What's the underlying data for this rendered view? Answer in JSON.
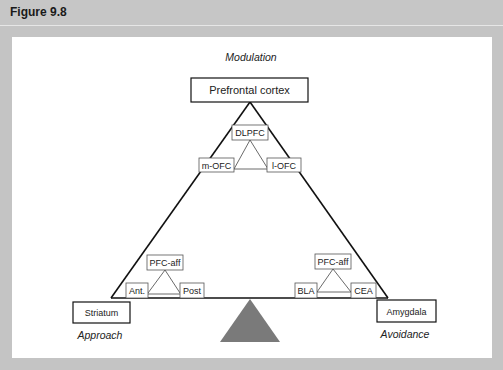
{
  "figure": {
    "title": "Figure 9.8"
  },
  "diagram": {
    "top_label": "Modulation",
    "apex_node": "Prefrontal cortex",
    "left_node": "Striatum",
    "right_node": "Amygdala",
    "left_caption": "Approach",
    "right_caption": "Avoidance",
    "top_subtriangle": {
      "top": "DLPFC",
      "left": "m-OFC",
      "right": "l-OFC"
    },
    "left_subtriangle": {
      "top": "PFC-aff",
      "left": "Ant.",
      "right": "Post"
    },
    "right_subtriangle": {
      "top": "PFC-aff",
      "left": "BLA",
      "right": "CEA"
    },
    "colors": {
      "line": "#111111",
      "fulcrum": "#7a7a7a",
      "header_bg": "#c6c6c6",
      "frame_bg": "#c4c4c4",
      "panel_bg": "#ffffff"
    }
  }
}
